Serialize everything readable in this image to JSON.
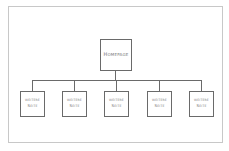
{
  "diagram": {
    "type": "sitemap-tree",
    "root": {
      "label": "Homepage"
    },
    "children": [
      {
        "line1": "weitere",
        "line2": "Seite"
      },
      {
        "line1": "weitere",
        "line2": "Seite"
      },
      {
        "line1": "weitere",
        "line2": "Seite"
      },
      {
        "line1": "weitere",
        "line2": "Seite"
      },
      {
        "line1": "weitere",
        "line2": "Seite"
      }
    ],
    "colors": {
      "stroke": "#6a6a6a",
      "text": "#7a7a7a",
      "frame": "#c8c8c8",
      "background": "#ffffff"
    }
  }
}
